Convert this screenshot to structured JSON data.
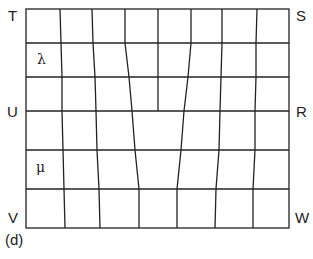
{
  "diagram": {
    "panel_label": "(d)",
    "corner_labels": {
      "top_left": "T",
      "top_right": "S",
      "mid_left": "U",
      "mid_right": "R",
      "bottom_left": "V",
      "bottom_right": "W"
    },
    "region_labels": {
      "upper": "λ",
      "lower": "μ"
    },
    "line_color": "#222222",
    "grid": {
      "rows_y": [
        9,
        43,
        77,
        111,
        150,
        189,
        228
      ],
      "left_x": 26,
      "right_x": 289
    }
  }
}
